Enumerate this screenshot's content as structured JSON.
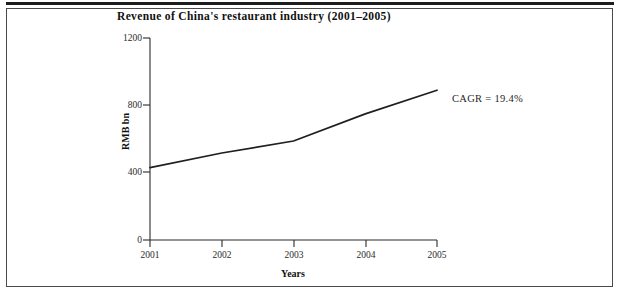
{
  "figure": {
    "title": "Revenue of China's restaurant industry (2001–2005)",
    "annotation": "CAGR  =  19.4%",
    "border_color": "#4a4a4a",
    "rule_color": "#1d1d1d",
    "line_color": "#1f1f1f"
  },
  "chart_data": {
    "type": "line",
    "title": "Revenue of China's restaurant industry (2001–2005)",
    "xlabel": "Years",
    "ylabel": "RMB bn",
    "x": [
      2001,
      2002,
      2003,
      2004,
      2005
    ],
    "xtick_labels": [
      "2001",
      "2002",
      "2003",
      "2004",
      "2005"
    ],
    "values": [
      430,
      517,
      588,
      749,
      890
    ],
    "series": [
      {
        "name": "Revenue",
        "values": [
          430,
          517,
          588,
          749,
          890
        ]
      }
    ],
    "ylim": [
      0,
      1200
    ],
    "ytick_values": [
      0,
      400,
      800,
      1200
    ],
    "ytick_labels": [
      "0",
      "400",
      "800",
      "1200"
    ],
    "xlim": [
      2001,
      2005
    ],
    "grid": false,
    "legend": false,
    "annotations": [
      {
        "text": "CAGR  =  19.4%",
        "x": 2005,
        "y": 890
      }
    ]
  }
}
